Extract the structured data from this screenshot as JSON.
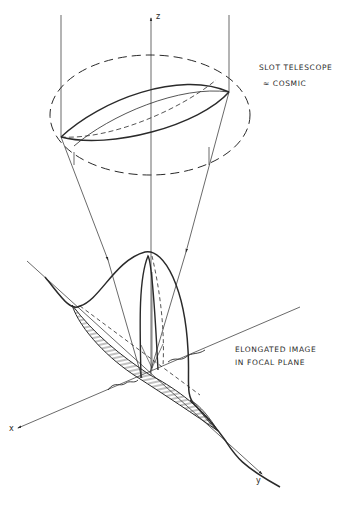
{
  "figure": {
    "type": "optical diagram",
    "labels": {
      "telescope_title": "SLOT TELESCOPE",
      "telescope_subtitle": "≈ COSMIC",
      "image_line1": "ELONGATED IMAGE",
      "image_line2": "IN FOCAL PLANE"
    },
    "axes": {
      "x": "x",
      "y": "y",
      "z": "z"
    },
    "colors": {
      "ink": "#2a2a2a",
      "background": "#ffffff"
    }
  }
}
